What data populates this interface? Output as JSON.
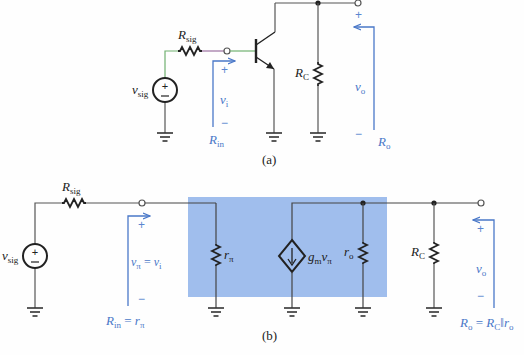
{
  "figure": {
    "colors": {
      "wire": "#555555",
      "component": "#222222",
      "annotation": "#4a78c8",
      "highlight_box": "#8fb3ea",
      "input_wire_accent": "#9a6fa0",
      "input_wire_green": "#6fb06f"
    },
    "part_a": {
      "caption": "(a)",
      "source": {
        "symbol": "v",
        "sub": "sig",
        "plus": "+",
        "minus": "−"
      },
      "r_sig": {
        "symbol": "R",
        "sub": "sig"
      },
      "transistor": "npn-bjt",
      "r_c": {
        "symbol": "R",
        "sub": "C"
      },
      "input_voltage": {
        "symbol": "v",
        "sub": "i",
        "plus": "+",
        "minus": "−"
      },
      "input_resistance": {
        "symbol": "R",
        "sub": "in"
      },
      "output_voltage": {
        "symbol": "v",
        "sub": "o",
        "plus": "+",
        "minus": "−"
      },
      "output_resistance": {
        "symbol": "R",
        "sub": "o"
      }
    },
    "part_b": {
      "caption": "(b)",
      "source": {
        "symbol": "v",
        "sub": "sig",
        "plus": "+",
        "minus": "−"
      },
      "r_sig": {
        "symbol": "R",
        "sub": "sig"
      },
      "r_pi": {
        "symbol": "r",
        "sub": "π"
      },
      "dependent_source": {
        "g": "g",
        "g_sub": "m",
        "v": "v",
        "v_sub": "π"
      },
      "r_o": {
        "symbol": "r",
        "sub": "o"
      },
      "r_c": {
        "symbol": "R",
        "sub": "C"
      },
      "input_voltage": {
        "lhs": "v",
        "lhs_sub": "π",
        "eq": " = ",
        "rhs": "v",
        "rhs_sub": "i",
        "plus": "+",
        "minus": "−"
      },
      "input_resistance": {
        "lhs": "R",
        "lhs_sub": "in",
        "eq": " = ",
        "rhs": "r",
        "rhs_sub": "π"
      },
      "output_voltage": {
        "symbol": "v",
        "sub": "o",
        "plus": "+",
        "minus": "−"
      },
      "output_resistance": {
        "lhs": "R",
        "lhs_sub": "o",
        "eq": " = ",
        "r1": "R",
        "r1_sub": "C",
        "par": "‖",
        "r2": "r",
        "r2_sub": "o"
      }
    }
  }
}
